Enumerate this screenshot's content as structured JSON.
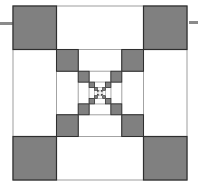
{
  "diagram": {
    "type": "recursive-nested-squares",
    "canvas": {
      "width": 198,
      "height": 195
    },
    "origin": {
      "x": 13,
      "y": 6
    },
    "size": 174,
    "levels": 6,
    "corner_ratio": 0.25,
    "colors": {
      "background": "#ffffff",
      "fill": "#808080",
      "stroke": "#2e2e2e",
      "frame_stroke": "#9a9a9a",
      "side_bar": "#8a8a8a"
    },
    "side_bars": [
      {
        "name": "left-side-bar",
        "x": 0,
        "y": 22,
        "width": 13
      },
      {
        "name": "right-side-bar",
        "x": 189,
        "y": 21,
        "width": 9
      }
    ]
  }
}
